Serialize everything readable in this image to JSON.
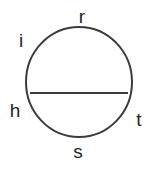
{
  "figure": {
    "kind": "circle-with-chord-diagram",
    "background_color": "#FFFFFF",
    "stroke_color": "#3C3C3C",
    "chord_color": "#3C3C3C",
    "text_color": "#262626",
    "circle": {
      "center_x": 79,
      "center_y": 82,
      "radius_x": 53,
      "radius_y": 55,
      "stroke_width": 2
    },
    "chord": {
      "x1": 30,
      "y1": 93,
      "x2": 128,
      "y2": 93,
      "stroke_width": 2,
      "orientation": "horizontal"
    },
    "labels": {
      "top": "r",
      "upper_left": "i",
      "lower_left": "h",
      "lower_right": "t",
      "bottom": "s"
    }
  }
}
